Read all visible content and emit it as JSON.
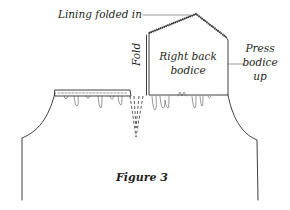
{
  "figure": {
    "caption": "Figure 3",
    "labels": {
      "lining": "Lining folded in",
      "fold": "Fold",
      "bodice_line1": "Right back",
      "bodice_line2": "bodice",
      "press_line1": "Press",
      "press_line2": "bodice",
      "press_line3": "up"
    },
    "colors": {
      "ink": "#231f20",
      "background": "#ffffff"
    }
  }
}
